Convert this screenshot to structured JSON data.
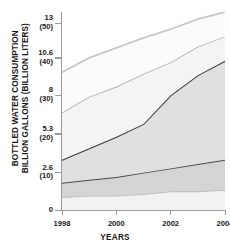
{
  "chart_data": {
    "type": "area",
    "title": "",
    "ylabel": "BOTTLED WATER CONSUMPTION\nBILLION GALLONS (BILLION LITERS)",
    "xlabel": "YEARS",
    "x": [
      1998,
      1999,
      2000,
      2001,
      2002,
      2003,
      2004
    ],
    "xtick_labels": [
      "1998",
      "2000",
      "2002",
      "2004"
    ],
    "xtick_values": [
      1998,
      2000,
      2002,
      2004
    ],
    "xlim": [
      1998,
      2004
    ],
    "ytick_labels": [
      {
        "gallons": "13",
        "liters": "(50)"
      },
      {
        "gallons": "10.6",
        "liters": "(40)"
      },
      {
        "gallons": "8",
        "liters": "(30)"
      },
      {
        "gallons": "5.3",
        "liters": "(20)"
      },
      {
        "gallons": "2.6",
        "liters": "(10)"
      },
      {
        "gallons": "0",
        "liters": ""
      }
    ],
    "ytick_values": [
      13,
      10.6,
      8,
      5.3,
      2.6,
      0
    ],
    "ylim": [
      0,
      13.8
    ],
    "grid": false,
    "legend": "none",
    "stacked": true,
    "series": [
      {
        "name": "band-1-bottom",
        "fill": "#f2f2f2",
        "line_color": "#bcbcbc",
        "line_width": 1.6,
        "boundary_values": [
          0.9,
          1.0,
          1.0,
          1.1,
          1.3,
          1.3,
          1.4
        ]
      },
      {
        "name": "band-2",
        "fill": "#d4d4d4",
        "line_color": "#4a4a4a",
        "line_width": 1.8,
        "boundary_values": [
          1.9,
          2.1,
          2.3,
          2.6,
          2.9,
          3.2,
          3.5
        ]
      },
      {
        "name": "band-3",
        "fill": "#e0e0e0",
        "line_color": "#3a3a3a",
        "line_width": 2.0,
        "boundary_values": [
          3.5,
          4.3,
          5.1,
          6.0,
          8.0,
          9.4,
          10.4
        ]
      },
      {
        "name": "band-4",
        "fill": "#f4f4f4",
        "line_color": "#b4b4b4",
        "line_width": 1.8,
        "boundary_values": [
          6.8,
          7.9,
          8.6,
          9.5,
          10.3,
          11.4,
          12.1
        ]
      },
      {
        "name": "band-5-top",
        "fill": "#fbfbfb",
        "line_color": "#c8c8c8",
        "line_width": 1.8,
        "boundary_values": [
          9.6,
          10.6,
          11.3,
          12.0,
          12.6,
          13.3,
          13.8
        ]
      }
    ]
  }
}
